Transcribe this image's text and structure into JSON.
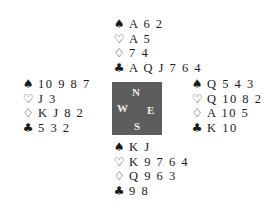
{
  "suits": {
    "spades": "♠",
    "hearts": "♡",
    "diamonds": "♢",
    "clubs": "♣"
  },
  "compass": {
    "north": "N",
    "west": "W",
    "east": "E",
    "south": "S",
    "color": "#5d5d5d"
  },
  "hands": {
    "north": {
      "spades": "A 6 2",
      "hearts": "A 5",
      "diamonds": "7 4",
      "clubs": "A Q J 7 6 4"
    },
    "west": {
      "spades": "10 9 8 7",
      "hearts": "J 3",
      "diamonds": "K J 8 2",
      "clubs": "5 3 2"
    },
    "east": {
      "spades": "Q 5 4 3",
      "hearts": "Q 10 8 2",
      "diamonds": "A 10 5",
      "clubs": "K 10"
    },
    "south": {
      "spades": "K J",
      "hearts": "K 9 7 6 4",
      "diamonds": "Q 9 6 3",
      "clubs": "9 8"
    }
  }
}
